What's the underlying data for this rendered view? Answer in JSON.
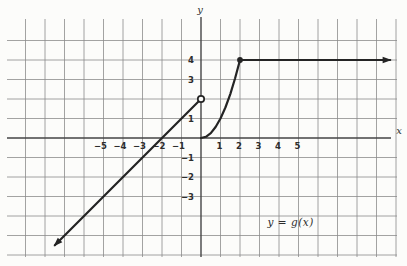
{
  "figure": {
    "background": "#fcfcfa",
    "grid_color": "#8b8b8b",
    "axis_color": "#454545",
    "curve_color": "#242424",
    "tick_color": "#2d2d2d"
  },
  "chart_data": {
    "type": "line",
    "title": "",
    "xlabel": "x",
    "ylabel": "y",
    "annotation": "y = g(x)",
    "annotation_pos": [
      4.6,
      -4.35
    ],
    "grid": true,
    "x_grid_range": [
      -9,
      10
    ],
    "y_grid_range": [
      -6,
      5
    ],
    "xlim": [
      -9,
      10
    ],
    "ylim": [
      -6,
      5
    ],
    "x_tick_values": [
      -5,
      -4,
      -3,
      -2,
      -1,
      1,
      2,
      3,
      4,
      5
    ],
    "x_tick_labels": [
      "−5",
      "−4",
      "−3",
      "−2",
      "−1",
      "1",
      "2",
      "3",
      "4",
      "5"
    ],
    "y_tick_values": [
      4,
      3,
      1,
      -1,
      -2,
      -3
    ],
    "y_tick_labels": [
      "4",
      "3",
      "1",
      "−1",
      "−2",
      "−3"
    ],
    "series": [
      {
        "id": "linear-piece",
        "name": "line y = x + 2 for x < 0",
        "x": [
          -7.5,
          0
        ],
        "y": [
          -5.5,
          2
        ],
        "arrow_start": true,
        "endpoint": "open-circle"
      },
      {
        "id": "parabola-piece",
        "name": "curve y = x^2 for 0 <= x <= 2",
        "x": [
          0,
          0.25,
          0.5,
          0.75,
          1,
          1.25,
          1.5,
          1.75,
          2
        ],
        "y": [
          0,
          0.0625,
          0.25,
          0.5625,
          1,
          1.5625,
          2.25,
          3.0625,
          4
        ],
        "endpoint": "filled-dot"
      },
      {
        "id": "constant-piece",
        "name": "ray y = 4 for x >= 2",
        "x": [
          2,
          9.7
        ],
        "y": [
          4,
          4
        ],
        "arrow_end": true
      }
    ]
  }
}
